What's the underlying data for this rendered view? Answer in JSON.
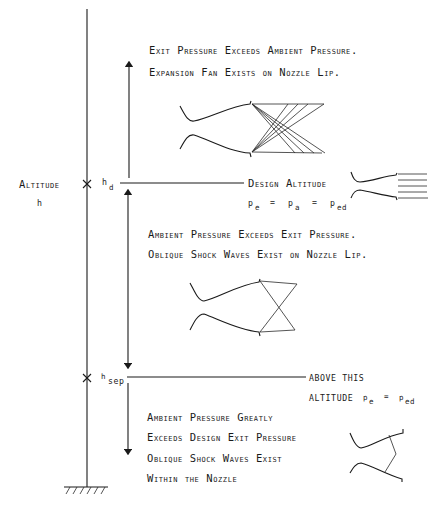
{
  "diagram": {
    "axis": {
      "label": "Altitude",
      "symbol": "h",
      "markers": [
        {
          "symbol": "h",
          "subscript": "d"
        },
        {
          "symbol": "h",
          "subscript": "sep"
        }
      ]
    },
    "regions": {
      "over_expanded_above": {
        "line1": "Exit Pressure Exceeds Ambient Pressure.",
        "line2": "Expansion Fan Exists on Nozzle Lip."
      },
      "design": {
        "label": "Design Altitude",
        "eq": {
          "p1": "p",
          "s1": "e",
          "p2": "p",
          "s2": "a",
          "p3": "p",
          "s3": "ed",
          "eq_sign": "="
        }
      },
      "between": {
        "line1": "Ambient Pressure Exceeds Exit Pressure.",
        "line2": "Oblique Shock Waves Exist on Nozzle Lip."
      },
      "separation": {
        "line1": "ABOVE THIS",
        "line2": "ALTITUDE",
        "eq": {
          "p1": "p",
          "s1": "e",
          "p2": "p",
          "s2": "ed",
          "eq_sign": "="
        }
      },
      "below": {
        "line1": "Ambient Pressure Greatly",
        "line2": "Exceeds Design Exit Pressure",
        "line3": "Oblique Shock Waves Exist",
        "line4": "Within the Nozzle"
      }
    },
    "colors": {
      "ink": "#1a1a1a",
      "background": "#ffffff"
    }
  }
}
